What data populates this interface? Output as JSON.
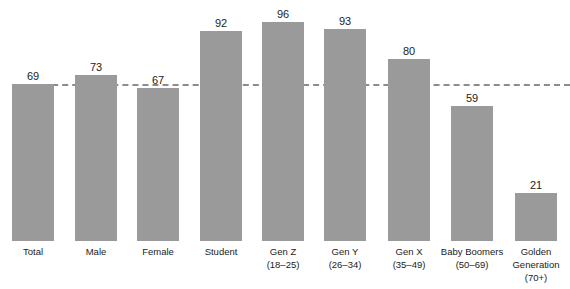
{
  "chart_data": {
    "type": "bar",
    "title": "",
    "xlabel": "",
    "ylabel": "",
    "ylim": [
      0,
      100
    ],
    "grid": false,
    "categories": [
      "Total",
      "Male",
      "Female",
      "Student",
      "Gen Z (18–25)",
      "Gen Y (26–34)",
      "Gen X (35–49)",
      "Baby Boomers (50–69)",
      "Golden Generation (70+)"
    ],
    "category_labels": [
      "Total",
      "Male",
      "Female",
      "Student",
      "Gen Z\n(18–25)",
      "Gen Y\n(26–34)",
      "Gen X\n(35–49)",
      "Baby Boomers\n(50–69)",
      "Golden\nGeneration\n(70+)"
    ],
    "values": [
      69,
      73,
      67,
      92,
      96,
      93,
      80,
      59,
      21
    ],
    "value_labels": [
      "69",
      "73",
      "67",
      "92",
      "96",
      "93",
      "80",
      "59",
      "21"
    ],
    "reference_line": {
      "value": 69,
      "style": "dashed",
      "label": "Total"
    },
    "colors": {
      "bar": "#9a9a9a",
      "reference_line": "#8c8c8c",
      "text": "#222222"
    }
  }
}
